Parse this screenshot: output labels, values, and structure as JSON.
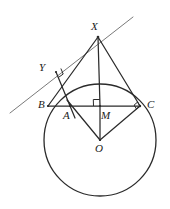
{
  "figure": {
    "background_color": "#ffffff",
    "line_color": "#2b2b2b",
    "tangent_color": "#7a7a7a",
    "label_color": "#1a1a1a"
  },
  "labels": {
    "X": "X",
    "Y": "Y",
    "B": "B",
    "A": "A",
    "M": "M",
    "C": "C",
    "O": "O"
  },
  "points": {
    "X": {
      "name": "X",
      "x": 98,
      "y": 37
    },
    "Y": {
      "name": "Y",
      "x": 56,
      "y": 72
    },
    "B": {
      "name": "B",
      "x": 48,
      "y": 106
    },
    "A": {
      "name": "A",
      "x": 70,
      "y": 106
    },
    "M": {
      "name": "M",
      "x": 100,
      "y": 106
    },
    "C": {
      "name": "C",
      "x": 140,
      "y": 106
    },
    "O": {
      "name": "O",
      "x": 100,
      "y": 140
    }
  },
  "circle": {
    "name": "main-circle",
    "center_x": 100,
    "center_y": 140,
    "radius": 56
  },
  "tangent_line": {
    "name": "tangent-line",
    "x1": 10,
    "y1": 113,
    "x2": 133,
    "y2": 17
  },
  "segments": [
    {
      "name": "segment-XB",
      "from": "X",
      "to": "B",
      "x1": 98,
      "y1": 37,
      "x2": 48,
      "y2": 106
    },
    {
      "name": "segment-XC",
      "from": "X",
      "to": "C",
      "x1": 98,
      "y1": 37,
      "x2": 140,
      "y2": 106
    },
    {
      "name": "segment-XM",
      "from": "X",
      "to": "M",
      "x1": 98,
      "y1": 37,
      "x2": 100,
      "y2": 106
    },
    {
      "name": "segment-BC",
      "from": "B",
      "to": "C",
      "x1": 48,
      "y1": 106,
      "x2": 140,
      "y2": 106
    },
    {
      "name": "segment-MO",
      "from": "M",
      "to": "O",
      "x1": 100,
      "y1": 106,
      "x2": 100,
      "y2": 140
    },
    {
      "name": "segment-OA",
      "from": "O",
      "to": "A",
      "x1": 100,
      "y1": 140,
      "x2": 67,
      "y2": 100
    },
    {
      "name": "segment-OC",
      "from": "O",
      "to": "C",
      "x1": 100,
      "y1": 140,
      "x2": 140,
      "y2": 106
    },
    {
      "name": "segment-YA",
      "from": "Y",
      "to": "A",
      "x1": 56,
      "y1": 72,
      "x2": 75,
      "y2": 118
    }
  ],
  "right_angles": [
    {
      "name": "right-angle-at-Y",
      "at": "Y",
      "x": 56,
      "y": 72
    },
    {
      "name": "right-angle-at-M",
      "at": "M",
      "x": 100,
      "y": 106
    },
    {
      "name": "right-angle-at-C",
      "at": "C",
      "x": 140,
      "y": 106
    }
  ],
  "label_positions": {
    "X": {
      "left": 91,
      "top": 21
    },
    "Y": {
      "left": 39,
      "top": 62
    },
    "B": {
      "left": 38,
      "top": 99
    },
    "A": {
      "left": 63,
      "top": 110
    },
    "M": {
      "left": 101,
      "top": 110
    },
    "C": {
      "left": 147,
      "top": 99
    },
    "O": {
      "left": 95,
      "top": 143
    }
  }
}
